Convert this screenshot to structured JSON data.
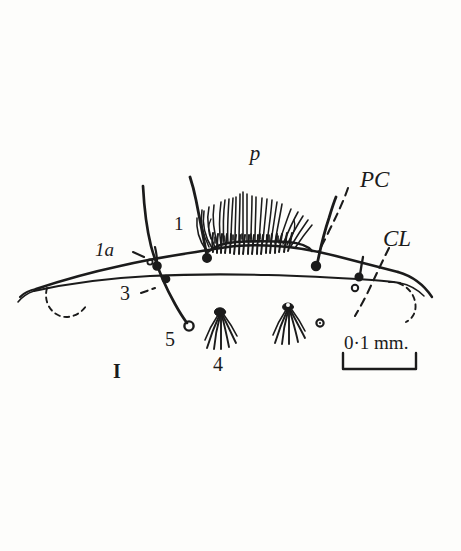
{
  "figure": {
    "plate_number": "I",
    "background_color": "#fdfdfb",
    "ink_color": "#1b1b1b"
  },
  "labels": {
    "pecten": "p",
    "pc": "PC",
    "cl": "CL",
    "seta_1": "1",
    "seta_1a": "1a",
    "seta_3": "3",
    "seta_4": "4",
    "seta_5": "5"
  },
  "scale_bar": {
    "text": "0·1 mm.",
    "value": "0.1",
    "unit": "mm."
  },
  "icon_names": {
    "pecten_brush": "brush-comb-icon",
    "tuft_seta": "palmate-seta-icon",
    "socket": "seta-socket-icon",
    "leader": "dashed-leader-icon"
  }
}
